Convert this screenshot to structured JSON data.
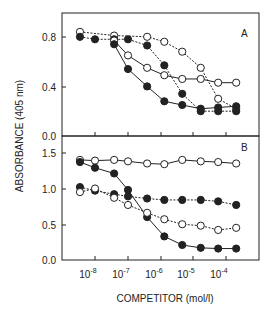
{
  "chart_data": [
    {
      "panel": "A",
      "type": "line",
      "title": "",
      "panel_label": "A",
      "xlabel": "COMPETITOR (mol/l)",
      "ylabel": "ABSORBANCE (405 nm)",
      "xscale": "log",
      "xlim": [
        2e-09,
        0.0005
      ],
      "ylim": [
        0.0,
        1.0
      ],
      "yticks": [
        "0.0",
        "0.4",
        "0.8"
      ],
      "grid": false,
      "series": [
        {
          "name": "open-dashed-1",
          "marker": "open",
          "line": "dashed",
          "x": [
            3.5e-09,
            3.8e-08,
            3.8e-07,
            1.26e-06,
            4.4e-06,
            1.6e-05,
            5.4e-05,
            0.00019
          ],
          "y": [
            0.84,
            0.81,
            0.8,
            0.76,
            0.68,
            0.55,
            0.3,
            0.22
          ]
        },
        {
          "name": "filled-dashed-1",
          "marker": "filled",
          "line": "dashed",
          "x": [
            3.5e-09,
            1e-08,
            3.8e-08,
            1e-07,
            3.8e-07,
            1.26e-06,
            4.4e-06,
            1.6e-05,
            5.4e-05,
            0.00019
          ],
          "y": [
            0.8,
            0.78,
            0.78,
            0.78,
            0.73,
            0.57,
            0.34,
            0.2,
            0.2,
            0.2
          ]
        },
        {
          "name": "open-solid-2",
          "marker": "open",
          "line": "solid",
          "x": [
            3.8e-08,
            1e-07,
            3.8e-07,
            1.26e-06,
            4.4e-06,
            1.6e-05,
            5.4e-05,
            0.00019
          ],
          "y": [
            0.77,
            0.65,
            0.55,
            0.49,
            0.46,
            0.46,
            0.43,
            0.43
          ]
        },
        {
          "name": "filled-solid-2",
          "marker": "filled",
          "line": "solid",
          "x": [
            3.8e-08,
            1e-07,
            3.8e-07,
            1.26e-06,
            4.4e-06,
            1.6e-05,
            5.4e-05,
            0.00019
          ],
          "y": [
            0.74,
            0.54,
            0.4,
            0.28,
            0.25,
            0.22,
            0.23,
            0.24
          ]
        }
      ]
    },
    {
      "panel": "B",
      "type": "line",
      "title": "",
      "panel_label": "B",
      "xlabel": "COMPETITOR (mol/l)",
      "ylabel": "ABSORBANCE (405 nm)",
      "xscale": "log",
      "xlim": [
        2e-09,
        0.0005
      ],
      "ylim": [
        0.0,
        1.7
      ],
      "yticks": [
        "0.0",
        "0.5",
        "1.0",
        "1.5"
      ],
      "xticks": [
        "10^-8",
        "10^-7",
        "10^-6",
        "10^-5",
        "10^-4"
      ],
      "grid": false,
      "series": [
        {
          "name": "open-solid-top",
          "marker": "open",
          "line": "solid",
          "x": [
            3.5e-09,
            1e-08,
            3.8e-08,
            1e-07,
            3.8e-07,
            1.26e-06,
            4.4e-06,
            1.6e-05,
            5.4e-05,
            0.00019
          ],
          "y": [
            1.4,
            1.39,
            1.4,
            1.38,
            1.35,
            1.34,
            1.4,
            1.38,
            1.37,
            1.35
          ]
        },
        {
          "name": "filled-solid-steep",
          "marker": "filled",
          "line": "solid",
          "x": [
            3.5e-09,
            1e-08,
            3.8e-08,
            1e-07,
            3.8e-07,
            1.26e-06,
            4.4e-06,
            1.6e-05,
            5.4e-05,
            0.00019
          ],
          "y": [
            1.37,
            1.29,
            1.21,
            0.98,
            0.6,
            0.33,
            0.21,
            0.17,
            0.16,
            0.16
          ]
        },
        {
          "name": "filled-dashed",
          "marker": "filled",
          "line": "dashed",
          "x": [
            3.5e-09,
            1e-08,
            3.8e-08,
            1e-07,
            3.8e-07,
            1.26e-06,
            4.4e-06,
            1.6e-05,
            5.4e-05,
            0.00019
          ],
          "y": [
            1.02,
            0.97,
            0.92,
            0.89,
            0.86,
            0.84,
            0.84,
            0.84,
            0.82,
            0.77
          ]
        },
        {
          "name": "open-dashed",
          "marker": "open",
          "line": "dashed",
          "x": [
            3.5e-09,
            1e-08,
            3.8e-08,
            1e-07,
            3.8e-07,
            1.26e-06,
            4.4e-06,
            1.6e-05,
            5.4e-05,
            0.00019
          ],
          "y": [
            0.95,
            1.0,
            0.87,
            0.77,
            0.66,
            0.57,
            0.5,
            0.48,
            0.42,
            0.45
          ]
        }
      ]
    }
  ],
  "labels": {
    "ylabel": "ABSORBANCE (405 nm)",
    "xlabel": "COMPETITOR (mol/l)",
    "panel_a": "A",
    "panel_b": "B",
    "a_yticks": [
      "0.0",
      "0.4",
      "0.8"
    ],
    "b_yticks": [
      "0.0",
      "0.5",
      "1.0",
      "1.5"
    ],
    "xtick_base": "10",
    "xtick_exps": [
      "-8",
      "-7",
      "-6",
      "-5",
      "-4"
    ]
  },
  "colors": {
    "ink": "#222222",
    "background": "#ffffff"
  }
}
